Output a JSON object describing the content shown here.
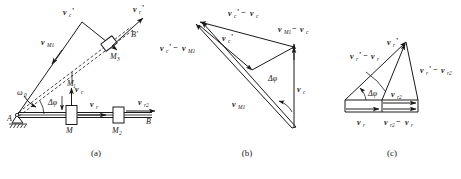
{
  "figure": {
    "captions": [
      {
        "id": "cap-a",
        "text": "(a)"
      },
      {
        "id": "cap-b",
        "text": "(b)"
      },
      {
        "id": "cap-c",
        "text": "(c)"
      }
    ],
    "ink_color": "#1a1a1a",
    "background": "#ffffff"
  },
  "panel_a": {
    "name": "mechanism-diagram",
    "labels": {
      "pivot": "A",
      "end_point": "B",
      "end_point_prime": "B'",
      "slider_m": "M",
      "slider_m1": "M",
      "slider_m1_sub": "1",
      "slider_m2": "M",
      "slider_m2_sub": "2",
      "slider_m3": "M",
      "slider_m3_sub": "3",
      "omega": "ω",
      "omega_sub": "0",
      "delta_phi": "Δφ",
      "v_c_prime": "v",
      "v_c_prime_sub": "c",
      "v_c_prime_mark": "'",
      "v_r_prime": "v",
      "v_r_prime_sub": "r",
      "v_r_prime_mark": "'",
      "v_M1": "v",
      "v_M1_sub": "M1",
      "v_c": "v",
      "v_c_sub": "c",
      "v_r": "v",
      "v_r_sub": "r",
      "v_r2": "v",
      "v_r2_sub": "r2"
    }
  },
  "panel_b": {
    "name": "velocity-triangle-b",
    "labels": {
      "v_c_prime_minus_v_c_a": "v",
      "v_c_prime_minus_v_c_sub": "c",
      "v_c_prime_minus_v_c_rest": "' − ",
      "v_c_prime_minus_v_c_b": "v",
      "v_c_prime_minus_v_c_sub2": "c",
      "v_M1_minus_v_c_a": "v",
      "v_M1_minus_v_c_sub": "M1",
      "v_M1_minus_v_c_mid": " − ",
      "v_M1_minus_v_c_b": "v",
      "v_M1_minus_v_c_sub2": "c",
      "v_c_prime_minus_v_M1_a": "v",
      "v_c_prime_minus_v_M1_sub": "c",
      "v_c_prime_minus_v_M1_mid": "' − ",
      "v_c_prime_minus_v_M1_b": "v",
      "v_c_prime_minus_v_M1_sub2": "M1",
      "v_c_prime": "v",
      "v_c_prime_sub": "c",
      "v_c_prime_mark": "'",
      "v_M1": "v",
      "v_M1_sub": "M1",
      "v_c": "v",
      "v_c_sub": "c",
      "delta_phi": "Δφ"
    }
  },
  "panel_c": {
    "name": "velocity-triangle-c",
    "labels": {
      "v_r_prime": "v",
      "v_r_prime_sub": "r",
      "v_r_prime_mark": "'",
      "v_r_prime_minus_v_r_a": "v",
      "v_r_prime_minus_v_r_sub": "r",
      "v_r_prime_minus_v_r_mid": "' − ",
      "v_r_prime_minus_v_r_b": "v",
      "v_r_prime_minus_v_r_sub2": "r",
      "v_r_prime_minus_v_r2_a": "v",
      "v_r_prime_minus_v_r2_sub": "r",
      "v_r_prime_minus_v_r2_mid": "' − ",
      "v_r_prime_minus_v_r2_b": "v",
      "v_r_prime_minus_v_r2_sub2": "r2",
      "v_r2": "v",
      "v_r2_sub": "r2",
      "v_r": "v",
      "v_r_sub": "r",
      "v_r2_minus_v_r_a": "v",
      "v_r2_minus_v_r_sub": "r2",
      "v_r2_minus_v_r_mid": " − ",
      "v_r2_minus_v_r_b": "v",
      "v_r2_minus_v_r_sub2": "r",
      "delta_phi": "Δφ"
    }
  }
}
